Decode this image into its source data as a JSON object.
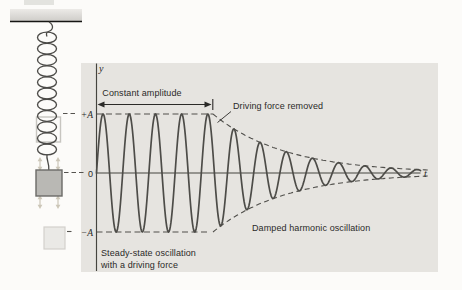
{
  "figure": {
    "panel_bg": "#e6e4e0",
    "ink": "#2b2a28",
    "curve_color": "#4d4c48",
    "axis_color": "#45443f",
    "labels": {
      "y_axis": "y",
      "t_axis": "t",
      "plus_amplitude": "+A",
      "zero": "0",
      "minus_amplitude": "−A",
      "constant_amplitude": "Constant amplitude",
      "driving_force_removed": "Driving force removed",
      "steady_state_line1": "Steady-state oscillation",
      "steady_state_line2": "with a driving force",
      "damped": "Damped harmonic oscillation"
    }
  },
  "chart_data": {
    "type": "line",
    "title": "",
    "xlabel": "t",
    "ylabel": "y",
    "y_levels": [
      "+A",
      "0",
      "−A"
    ],
    "series": [
      {
        "name": "displacement",
        "form": "y = A sin(2πt/T) while driven; y = A e^(−(t−t0)/τ) sin(2πt/T) after driving force removed at t0"
      }
    ],
    "geometry": {
      "x_start": 96.5,
      "x_axis_end": 421,
      "x_transition": 213,
      "x_converge": 429,
      "center_y": 173,
      "amplitude_px": 59,
      "period_px": 26.2,
      "decay_tau_px": 72,
      "plus_a_y": 114,
      "minus_a_y": 232,
      "coil_count": 11
    }
  }
}
